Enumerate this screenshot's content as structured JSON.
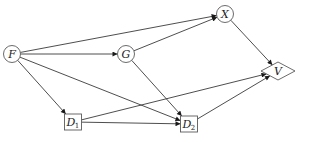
{
  "diagram": {
    "type": "directed-graph",
    "nodes": [
      {
        "id": "F",
        "label": "F",
        "sub": "",
        "shape": "circle",
        "x": 12,
        "y": 54,
        "r": 8.5
      },
      {
        "id": "G",
        "label": "G",
        "sub": "",
        "shape": "circle",
        "x": 126,
        "y": 54,
        "r": 8.5
      },
      {
        "id": "X",
        "label": "X",
        "sub": "",
        "shape": "circle",
        "x": 225,
        "y": 14,
        "r": 8.5
      },
      {
        "id": "V",
        "label": "V",
        "sub": "",
        "shape": "diamond",
        "x": 278,
        "y": 71,
        "w": 34,
        "h": 18
      },
      {
        "id": "D1",
        "label": "D",
        "sub": "1",
        "shape": "box",
        "x": 73,
        "y": 122,
        "w": 17,
        "h": 16
      },
      {
        "id": "D2",
        "label": "D",
        "sub": "2",
        "shape": "box",
        "x": 189,
        "y": 124,
        "w": 17,
        "h": 16
      }
    ],
    "edges": [
      {
        "from": "F",
        "to": "X"
      },
      {
        "from": "F",
        "to": "G"
      },
      {
        "from": "F",
        "to": "D1"
      },
      {
        "from": "F",
        "to": "D2"
      },
      {
        "from": "G",
        "to": "X"
      },
      {
        "from": "G",
        "to": "D2"
      },
      {
        "from": "X",
        "to": "V"
      },
      {
        "from": "D1",
        "to": "V"
      },
      {
        "from": "D1",
        "to": "D2"
      },
      {
        "from": "D2",
        "to": "V"
      }
    ],
    "colors": {
      "edge": "#3a3a3a",
      "node_stroke": "#5a5a5a",
      "background": "#ffffff"
    }
  }
}
